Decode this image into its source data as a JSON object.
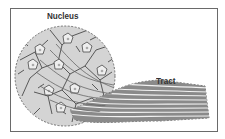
{
  "diagram": {
    "labels": {
      "nucleus": "Nucleus",
      "tract": "Tract"
    },
    "colors": {
      "frame": "#6a6a6a",
      "fill": "#d4d4d4",
      "outline": "#555555",
      "neuron_stroke": "#4a4a4a",
      "soma_fill": "#eeeeee",
      "fiber_dark": "#6a6a6a",
      "fiber_light": "#f2f2f2"
    },
    "components": [
      {
        "name": "nucleus",
        "shape": "circle",
        "description": "cluster of neuron cell bodies"
      },
      {
        "name": "tract",
        "shape": "bundle",
        "description": "bundle of axon fibers leaving the nucleus"
      }
    ]
  }
}
